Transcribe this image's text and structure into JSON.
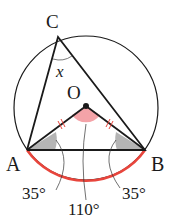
{
  "figure": {
    "points": {
      "A": "A",
      "B": "B",
      "C": "C",
      "O": "O"
    },
    "angle_label_x": "x",
    "angle_labels": {
      "left": "35°",
      "center": "110°",
      "right": "35°"
    },
    "colors": {
      "line": "#1a1a1a",
      "arc": "#e8453c",
      "center_angle_fill": "#f4a3a8",
      "base_angle_fill": "#b5b5b5",
      "tick": "#e8453c"
    }
  }
}
